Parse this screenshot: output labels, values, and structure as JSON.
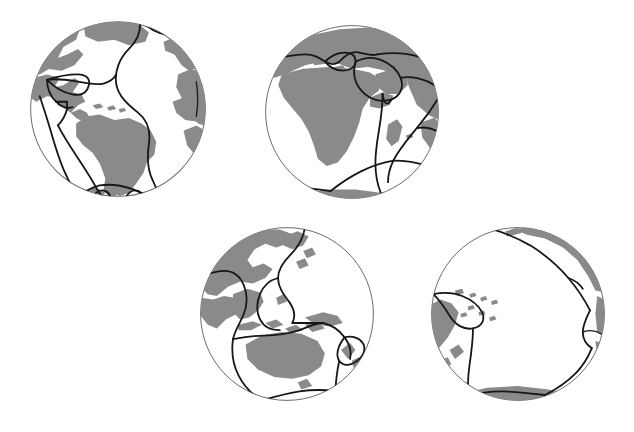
{
  "figure": {
    "title": "Global tectonic plate boundaries shown on four orthographic globe views",
    "background_color": "#ffffff",
    "land_color": "#8a8a8a",
    "ocean_color": "#ffffff",
    "plate_boundary_color": "#171717",
    "sphere_outline_color": "#6b6b6b",
    "globe_count": "4",
    "projection": "orthographic"
  },
  "globes": [
    {
      "id": "globe-atlantic-americas",
      "name": "Americas / Atlantic hemisphere",
      "center_longitude": "-60",
      "center_latitude": "0",
      "position": {
        "left": "27",
        "top": "18",
        "size": "182"
      },
      "visible_land": "North America, South America, Greenland, west Africa, west Europe",
      "visible_plates": "North American, South American, African, Nazca, Cocos, Caribbean, Scotia, Antarctic, Eurasian"
    },
    {
      "id": "globe-africa-eurasia",
      "name": "Africa / Eurasia hemisphere",
      "center_longitude": "25",
      "center_latitude": "5",
      "position": {
        "left": "262",
        "top": "22",
        "size": "180"
      },
      "visible_land": "Africa, Europe, Arabia, Madagascar, India, west Asia",
      "visible_plates": "African, Eurasian, Arabian, Anatolian, Indian, Somali, Antarctic"
    },
    {
      "id": "globe-asia-australia",
      "name": "Asia / Australia hemisphere",
      "center_longitude": "125",
      "center_latitude": "-10",
      "position": {
        "left": "197",
        "top": "224",
        "size": "180"
      },
      "visible_land": "East Asia, Southeast Asia, Indonesia, Australia, New Guinea, New Zealand",
      "visible_plates": "Eurasian, Philippine, Pacific, Australian, Indian, Antarctic"
    },
    {
      "id": "globe-pacific",
      "name": "Pacific hemisphere",
      "center_longitude": "-160",
      "center_latitude": "-10",
      "position": {
        "left": "428",
        "top": "224",
        "size": "180"
      },
      "visible_land": "Western North America edge, New Zealand, Pacific island arcs, Antarctica edge",
      "visible_plates": "Pacific, Australian, Antarctic, Nazca, North American"
    }
  ]
}
